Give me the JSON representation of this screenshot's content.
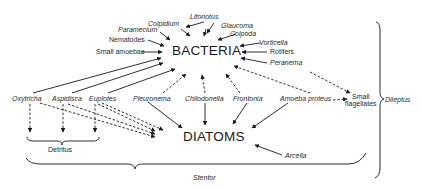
{
  "nodes": {
    "bacteria": "BACTERIA",
    "diatoms": "DIATOMS",
    "litonotus": "Litonotus",
    "colpidium": "Colpidium",
    "glaucoma": "Glaucoma",
    "paramecium": "Paramecium",
    "colpoda": "Colpoda",
    "nematodes": "Nematodes",
    "vorticella": "Vorticella",
    "small_amoebae": "Small amoebae",
    "rotifers": "Rotifers",
    "peranema": "Peranema",
    "oxytricha": "Oxytricha",
    "aspidisca": "Aspidisca",
    "euplotes": "Euplotes",
    "pleuronema": "Pleuronema",
    "chilodonella": "Chilodonella",
    "frontonia": "Frontonia",
    "amoeba_proteus": "Amoeba proteus",
    "small_flagellates_1": "Small",
    "small_flagellates_2": "flagellates",
    "arcella": "Arcella",
    "detritus": "Detritus"
  },
  "groups": {
    "stentor": "Stentor",
    "dileptus": "Dileptus"
  },
  "legend": {
    "solid_arrow": "feeds on (solid)",
    "dashed_arrow": "feeds on (dashed)"
  },
  "colors": {
    "ink": "#1a1a1a",
    "background": "#ffffff"
  }
}
